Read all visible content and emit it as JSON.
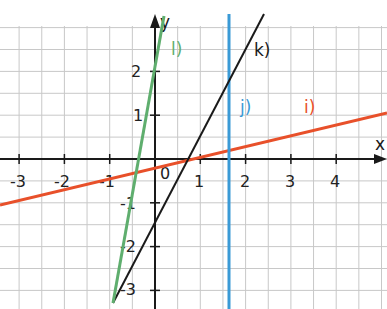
{
  "diagram": {
    "axes": {
      "x_label": "x",
      "y_label": "y",
      "origin_label": "0",
      "x_ticks": [
        "-3",
        "-2",
        "-1",
        "1",
        "2",
        "3",
        "4"
      ],
      "y_ticks": [
        "2",
        "1",
        "-1",
        "-2",
        "-3"
      ],
      "x_range": [
        -3.3,
        5
      ],
      "y_range": [
        -3.3,
        3.3
      ]
    },
    "lines": [
      {
        "id": "i",
        "label": "i)",
        "color": "#e8502a",
        "description": "shallow positive slope (~1/4), y-intercept ~ -0.2"
      },
      {
        "id": "j",
        "label": "j)",
        "color": "#3a9ad6",
        "description": "vertical line x ≈ 1.65"
      },
      {
        "id": "k",
        "label": "k)",
        "color": "#1a1a1a",
        "description": "positive slope ~2, y-intercept ~ -1.5"
      },
      {
        "id": "l",
        "label": "l)",
        "color": "#5fae6e",
        "description": "steep positive slope ~5.5, y-intercept ~ 2"
      }
    ],
    "grid_color": "#c8c8c8"
  }
}
